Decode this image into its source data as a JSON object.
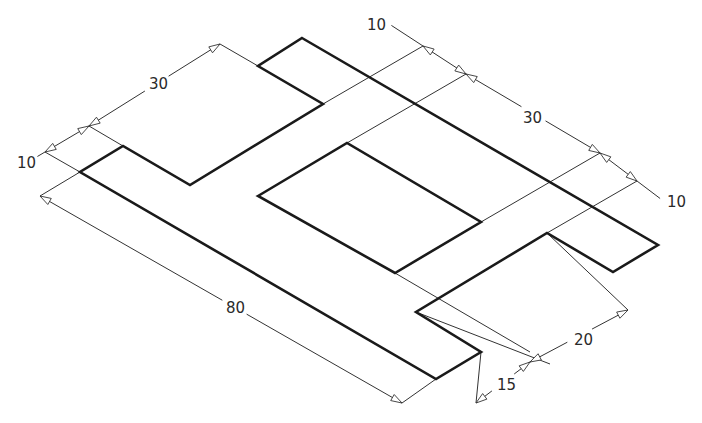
{
  "drawing": {
    "type": "isometric-dimensioned-drawing",
    "colors": {
      "line": "#1a1a1a",
      "dimension": "#333333",
      "background": "#ffffff"
    },
    "outline": [
      [
        302,
        38
      ],
      [
        658,
        245
      ],
      [
        613,
        272
      ],
      [
        547,
        233
      ],
      [
        416,
        312
      ],
      [
        481,
        352
      ],
      [
        436,
        379
      ],
      [
        80,
        172
      ],
      [
        123,
        146
      ],
      [
        190,
        185
      ],
      [
        323,
        104
      ],
      [
        258,
        66
      ]
    ],
    "hole": [
      [
        258,
        196
      ],
      [
        347,
        143
      ],
      [
        481,
        222
      ],
      [
        395,
        273
      ]
    ],
    "extension_lines": [
      [
        [
          258,
          66
        ],
        [
          220,
          44
        ]
      ],
      [
        [
          123,
          146
        ],
        [
          89,
          126
        ]
      ],
      [
        [
          80,
          172
        ],
        [
          45,
          152
        ]
      ],
      [
        [
          80,
          172
        ],
        [
          40,
          196
        ]
      ],
      [
        [
          323,
          104
        ],
        [
          423,
          46
        ]
      ],
      [
        [
          347,
          143
        ],
        [
          466,
          74
        ]
      ],
      [
        [
          481,
          222
        ],
        [
          600,
          153
        ]
      ],
      [
        [
          547,
          233
        ],
        [
          637,
          181
        ]
      ],
      [
        [
          395,
          273
        ],
        [
          530,
          352
        ]
      ],
      [
        [
          547,
          233
        ],
        [
          628,
          310
        ]
      ],
      [
        [
          436,
          379
        ],
        [
          402,
          403
        ]
      ],
      [
        [
          481,
          352
        ],
        [
          476,
          403
        ]
      ],
      [
        [
          416,
          312
        ],
        [
          550,
          364
        ]
      ]
    ],
    "dimensions": [
      {
        "id": "dim-30-top-left",
        "label": "30",
        "from": [
          89,
          126
        ],
        "to": [
          220,
          44
        ],
        "label_pos": [
          149,
          89
        ]
      },
      {
        "id": "dim-10-left",
        "label": "10",
        "from": [
          45,
          152
        ],
        "to": [
          89,
          126
        ],
        "label_pos": [
          17,
          168
        ]
      },
      {
        "id": "dim-80",
        "label": "80",
        "from": [
          40,
          196
        ],
        "to": [
          402,
          403
        ],
        "label_pos": [
          226,
          313
        ]
      },
      {
        "id": "dim-10-top-right",
        "label": "10",
        "from": [
          423,
          46
        ],
        "to": [
          466,
          74
        ],
        "label_pos": [
          367,
          30
        ]
      },
      {
        "id": "dim-30-right",
        "label": "30",
        "from": [
          466,
          74
        ],
        "to": [
          600,
          153
        ],
        "label_pos": [
          523,
          123
        ]
      },
      {
        "id": "dim-10-right",
        "label": "10",
        "from": [
          600,
          153
        ],
        "to": [
          637,
          181
        ],
        "label_pos": [
          667,
          207
        ]
      },
      {
        "id": "dim-20",
        "label": "20",
        "from": [
          530,
          362
        ],
        "to": [
          628,
          310
        ],
        "label_pos": [
          574,
          345
        ]
      },
      {
        "id": "dim-15",
        "label": "15",
        "from": [
          476,
          403
        ],
        "to": [
          530,
          362
        ],
        "label_pos": [
          497,
          390
        ]
      }
    ]
  },
  "labels": {
    "dim_30_top_left": "30",
    "dim_10_left": "10",
    "dim_80": "80",
    "dim_10_top_right": "10",
    "dim_30_right": "30",
    "dim_10_right": "10",
    "dim_20": "20",
    "dim_15": "15"
  }
}
